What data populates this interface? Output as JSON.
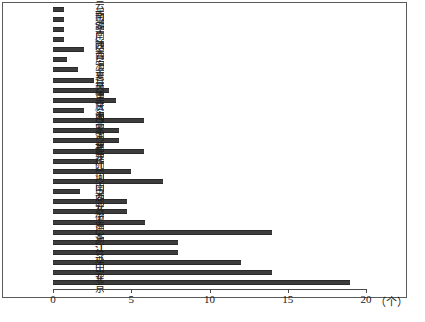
{
  "chart_data": {
    "type": "bar",
    "orientation": "horizontal",
    "title": "",
    "xlabel": "(个)",
    "ylabel": "",
    "xlim": [
      0,
      20
    ],
    "xticks": [
      0,
      5,
      10,
      15,
      20
    ],
    "xticklabels": [
      "0",
      "5",
      "10",
      "15",
      "20"
    ],
    "grid": false,
    "legend": null,
    "categories": [
      "云南",
      "新疆",
      "湖南",
      "广西",
      "陕西",
      "青海",
      "宁夏",
      "吉林",
      "天津",
      "重庆",
      "甘肃",
      "海南",
      "内蒙古",
      "河北",
      "福建",
      "黑龙江",
      "四川",
      "河南",
      "山西",
      "湖北",
      "安徽",
      "上海",
      "广东",
      "浙江",
      "江苏",
      "辽宁",
      "山东",
      "北京"
    ],
    "values": [
      0.7,
      0.7,
      0.7,
      0.7,
      2.0,
      0.9,
      1.6,
      2.6,
      3.6,
      4.0,
      2.0,
      5.8,
      4.2,
      4.2,
      5.8,
      2.9,
      5.0,
      7.0,
      1.7,
      4.7,
      4.7,
      5.9,
      14.0,
      8.0,
      8.0,
      12.0,
      14.0,
      19.0
    ],
    "unit_label": "(个)"
  },
  "caption": {
    "text": ""
  },
  "axis": {
    "unit": "（个）"
  }
}
